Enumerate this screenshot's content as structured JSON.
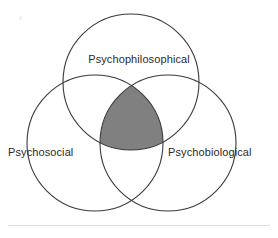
{
  "figure": {
    "type": "venn-diagram-3-set",
    "title": "",
    "background_color": "#ffffff",
    "stroke_color": "#3a3a3a",
    "stroke_width": 1,
    "intersection_fill": "#808080",
    "text_color": "#2b2b2b",
    "rule_color": "#dcdcdc",
    "sets": [
      {
        "id": "top",
        "label": "Psychophilosophical",
        "center_x": 131,
        "center_y": 82,
        "radius": 68,
        "label_x": 131,
        "label_y": 59
      },
      {
        "id": "left",
        "label": "Psychosocial",
        "center_x": 95,
        "center_y": 143,
        "radius": 68,
        "label_x": 48,
        "label_y": 152
      },
      {
        "id": "right",
        "label": "Psychobiological",
        "center_x": 168,
        "center_y": 143,
        "radius": 68,
        "label_x": 222,
        "label_y": 152
      }
    ],
    "center_region": {
      "name": "triple-intersection",
      "shaded": true,
      "fill": "#808080",
      "top_vertex_x": 131,
      "top_vertex_y": 77,
      "bottom_edge_y": 155
    },
    "bottom_rule": {
      "x": 8,
      "y": 225,
      "width": 262,
      "color": "#dcdcdc"
    }
  }
}
